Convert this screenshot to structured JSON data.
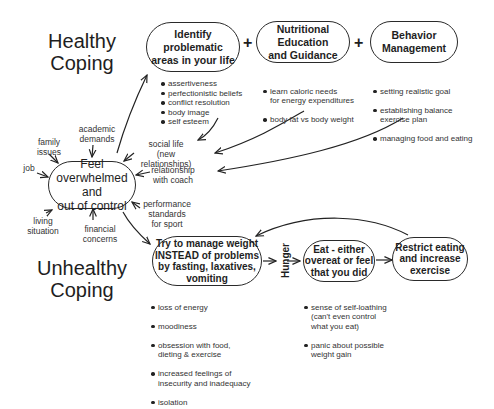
{
  "sections": {
    "healthy": {
      "line1": "Healthy",
      "line2": "Coping"
    },
    "unhealthy": {
      "line1": "Unhealthy",
      "line2": "Coping"
    }
  },
  "center_node": {
    "line1": "Feel overwhelmed",
    "line2": "and",
    "line3": "out of control"
  },
  "stressors": [
    {
      "line1": "family",
      "line2": "issues"
    },
    {
      "line1": "academic",
      "line2": "demands"
    },
    {
      "line1": "job",
      "line2": ""
    },
    {
      "line1": "living",
      "line2": "situation"
    },
    {
      "line1": "financial",
      "line2": "concerns"
    },
    {
      "line1": "performance",
      "line2": "standards",
      "line3": "for sport"
    },
    {
      "line1": "relationship",
      "line2": "with coach"
    },
    {
      "line1": "social life",
      "line2": "(new relationships)"
    }
  ],
  "healthy_nodes": [
    {
      "line1": "Identify problematic",
      "line2": "areas in your life",
      "bullets": [
        "assertiveness",
        "perfectionistic beliefs",
        "conflict resolution",
        "body image",
        "self esteem"
      ]
    },
    {
      "line1": "Nutritional Education",
      "line2": "and Guidance",
      "bullets": [
        "learn caloric needs\nfor energy expenditures",
        "body fat vs body weight"
      ]
    },
    {
      "line1": "Behavior",
      "line2": "Management",
      "bullets": [
        "setting realistic goal",
        "establishing balance\nexercise plan",
        "managing food and eating"
      ]
    }
  ],
  "plus_sign": "+",
  "unhealthy_nodes": [
    {
      "line1": "Try to manage weight",
      "line2": "INSTEAD of problems",
      "line3": "by fasting, laxatives,",
      "line4": "vomiting",
      "bullets": [
        "loss of energy",
        "moodiness",
        "obsession with food,\ndieting & exercise",
        "increased feelings of\ninsecurity and inadequacy",
        "isolation"
      ]
    },
    {
      "line1": "Eat - either",
      "line2": "overeat or feel",
      "line3": "that you did",
      "bullets": [
        "sense of self-loathing\n(can't even control\nwhat you eat)",
        "panic about possible\nweight gain"
      ]
    },
    {
      "line1": "Restrict eating",
      "line2": "and increase",
      "line3": "exercise",
      "bullets": []
    }
  ],
  "hunger_label": "Hunger",
  "colors": {
    "ink": "#1e1e1e",
    "background": "#ffffff"
  }
}
